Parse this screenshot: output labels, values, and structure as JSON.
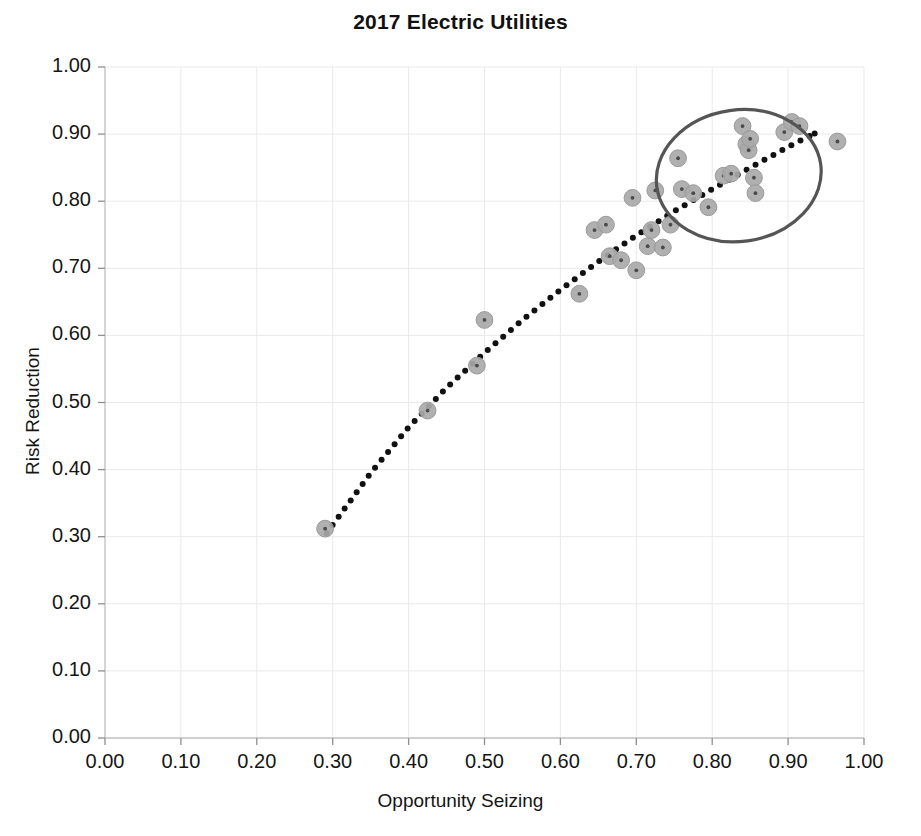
{
  "chart_data": {
    "type": "scatter",
    "title": "2017 Electric Utilities",
    "xlabel": "Opportunity Seizing",
    "ylabel": "Risk Reduction",
    "xlim": [
      0.0,
      1.0
    ],
    "ylim": [
      0.0,
      1.0
    ],
    "grid": true,
    "legend": "none",
    "x_ticks": [
      "0.00",
      "0.10",
      "0.20",
      "0.30",
      "0.40",
      "0.50",
      "0.60",
      "0.70",
      "0.80",
      "0.90",
      "1.00"
    ],
    "y_ticks": [
      "0.00",
      "0.10",
      "0.20",
      "0.30",
      "0.40",
      "0.50",
      "0.60",
      "0.70",
      "0.80",
      "0.90",
      "1.00"
    ],
    "marker_color": "#a9a9a9",
    "marker_edge_color": "#9a9a9a",
    "trendline_color": "#111111",
    "annotation_color": "#555555",
    "gridline_color": "#e9e9e9",
    "series": [
      {
        "name": "Electric Utilities",
        "points": [
          [
            0.29,
            0.312
          ],
          [
            0.425,
            0.488
          ],
          [
            0.49,
            0.555
          ],
          [
            0.5,
            0.623
          ],
          [
            0.625,
            0.662
          ],
          [
            0.645,
            0.757
          ],
          [
            0.66,
            0.765
          ],
          [
            0.665,
            0.718
          ],
          [
            0.68,
            0.712
          ],
          [
            0.695,
            0.805
          ],
          [
            0.7,
            0.697
          ],
          [
            0.715,
            0.733
          ],
          [
            0.72,
            0.757
          ],
          [
            0.725,
            0.816
          ],
          [
            0.735,
            0.731
          ],
          [
            0.745,
            0.765
          ],
          [
            0.755,
            0.864
          ],
          [
            0.76,
            0.818
          ],
          [
            0.775,
            0.812
          ],
          [
            0.795,
            0.791
          ],
          [
            0.815,
            0.838
          ],
          [
            0.825,
            0.841
          ],
          [
            0.84,
            0.912
          ],
          [
            0.845,
            0.885
          ],
          [
            0.848,
            0.876
          ],
          [
            0.85,
            0.893
          ],
          [
            0.855,
            0.835
          ],
          [
            0.857,
            0.812
          ],
          [
            0.895,
            0.903
          ],
          [
            0.905,
            0.918
          ],
          [
            0.915,
            0.912
          ],
          [
            0.965,
            0.889
          ]
        ]
      }
    ],
    "trendline": {
      "style": "dotted",
      "points": [
        [
          0.292,
          0.305
        ],
        [
          0.35,
          0.395
        ],
        [
          0.4,
          0.463
        ],
        [
          0.45,
          0.522
        ],
        [
          0.5,
          0.574
        ],
        [
          0.55,
          0.623
        ],
        [
          0.6,
          0.668
        ],
        [
          0.65,
          0.71
        ],
        [
          0.7,
          0.749
        ],
        [
          0.75,
          0.785
        ],
        [
          0.8,
          0.818
        ],
        [
          0.85,
          0.85
        ],
        [
          0.9,
          0.881
        ],
        [
          0.935,
          0.901
        ]
      ]
    },
    "annotations": [
      {
        "type": "ellipse",
        "label": "highlight-ellipse",
        "center_x": 0.835,
        "center_y": 0.838,
        "radius_x": 0.109,
        "radius_y": 0.098,
        "rotation_deg": -8
      }
    ]
  }
}
